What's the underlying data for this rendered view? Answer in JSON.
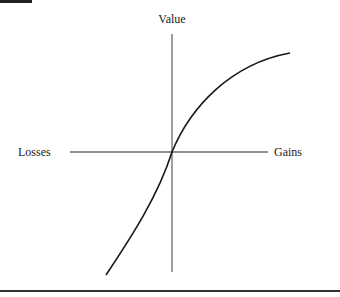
{
  "figure": {
    "type": "value-function-diagram",
    "y_axis_label": "Value",
    "x_axis_left_label": "Losses",
    "x_axis_right_label": "Gains",
    "colors": {
      "axis": "#6b6b6b",
      "curve": "#1a1a1a",
      "text": "#1a1a1a",
      "background": "#ffffff"
    },
    "geometry": {
      "origin": [
        172,
        152
      ],
      "x_axis": {
        "x1": 70,
        "x2": 268,
        "y": 152
      },
      "y_axis": {
        "x": 172,
        "y1": 34,
        "y2": 272
      },
      "curve_path": "M106,275 C132,236 158,196 172,152 C190,108 230,64 290,53"
    }
  }
}
